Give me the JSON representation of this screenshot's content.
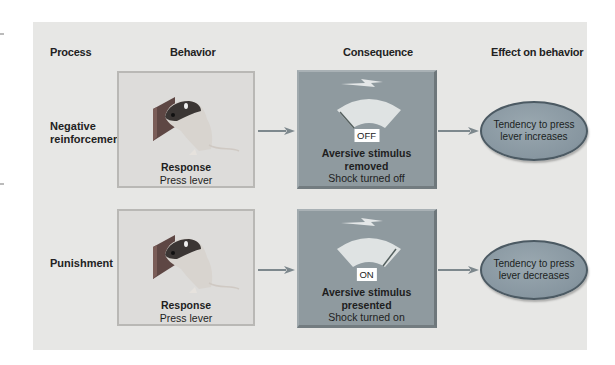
{
  "headers": {
    "process": "Process",
    "behavior": "Behavior",
    "consequence": "Consequence",
    "effect": "Effect on behavior"
  },
  "rows": [
    {
      "process": [
        "Negative",
        "reinforcement"
      ],
      "behavior": {
        "title": "Response",
        "subtitle": "Press lever",
        "icon": "rat-pressing-lever-icon"
      },
      "consequence": {
        "switch_state": "OFF",
        "title_line1": "Aversive stimulus",
        "title_line2": "removed",
        "subtitle": "Shock turned off",
        "icon": "shock-meter-icon",
        "needle": "left"
      },
      "effect": [
        "Tendency to press",
        "lever increases"
      ]
    },
    {
      "process": [
        "Punishment"
      ],
      "behavior": {
        "title": "Response",
        "subtitle": "Press lever",
        "icon": "rat-pressing-lever-icon"
      },
      "consequence": {
        "switch_state": "ON",
        "title_line1": "Aversive stimulus",
        "title_line2": "presented",
        "subtitle": "Shock turned on",
        "icon": "shock-meter-icon",
        "needle": "right"
      },
      "effect": [
        "Tendency to press",
        "lever decreases"
      ]
    }
  ],
  "colors": {
    "panel_bg": "#e7e7e5",
    "behavior_box": "#dddcda",
    "consequence_box": "#8f9a9f",
    "effect_ellipse": "#8b9aa3",
    "arrow": "#7d888d"
  }
}
